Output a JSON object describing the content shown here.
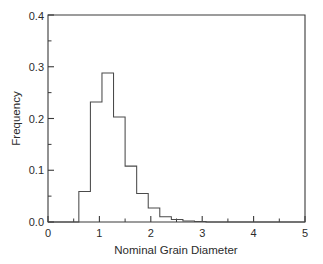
{
  "chart_data": {
    "type": "bar",
    "title": "",
    "subtitle": "",
    "xlabel": "Nominal Grain Diameter",
    "ylabel": "Frequency",
    "xlim": [
      0,
      5
    ],
    "ylim": [
      0,
      0.4
    ],
    "grid": false,
    "legend": null,
    "histogram": true,
    "bin_width": 0.225,
    "bin_start": 0.6,
    "bin_edges": [
      0.6,
      0.825,
      1.05,
      1.275,
      1.5,
      1.725,
      1.95,
      2.175,
      2.4,
      2.625,
      2.85,
      3.075
    ],
    "categories": [
      "0.6-0.825",
      "0.825-1.05",
      "1.05-1.275",
      "1.275-1.5",
      "1.5-1.725",
      "1.725-1.95",
      "1.95-2.175",
      "2.175-2.4",
      "2.4-2.625",
      "2.625-2.85",
      "2.85-3.075"
    ],
    "values": [
      0.059,
      0.232,
      0.288,
      0.203,
      0.108,
      0.055,
      0.027,
      0.01,
      0.005,
      0.002,
      0.001
    ],
    "x_ticks": [
      0,
      1,
      2,
      3,
      4,
      5
    ],
    "x_tick_labels": [
      "0",
      "1",
      "2",
      "3",
      "4",
      "5"
    ],
    "x_minor_ticks": [
      0.5,
      1.5,
      2.5,
      3.5,
      4.5
    ],
    "y_ticks": [
      0.0,
      0.1,
      0.2,
      0.3,
      0.4
    ],
    "y_tick_labels": [
      "0.0",
      "0.1",
      "0.2",
      "0.3",
      "0.4"
    ],
    "y_minor_ticks": [
      0.05,
      0.15,
      0.25,
      0.35
    ],
    "colors": {
      "bar_stroke": "#4a4a4a",
      "bar_fill": "none",
      "axis": "#3a3a3a",
      "text": "#2b2b2b",
      "background": "#ffffff"
    }
  },
  "axes": {
    "x_label": "Nominal Grain Diameter",
    "y_label": "Frequency"
  },
  "x_tick_labels": {
    "t0": "0",
    "t1": "1",
    "t2": "2",
    "t3": "3",
    "t4": "4",
    "t5": "5"
  },
  "y_tick_labels": {
    "t0": "0.0",
    "t1": "0.1",
    "t2": "0.2",
    "t3": "0.3",
    "t4": "0.4"
  }
}
